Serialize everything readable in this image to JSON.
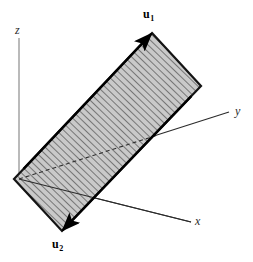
{
  "figure": {
    "background_color": "#ffffff"
  },
  "axes": [
    {
      "id": "z",
      "label": "z",
      "style": "italic",
      "color": "#8c8c8c",
      "x1": 19,
      "y1": 38,
      "x2": 19,
      "y2": 179,
      "arrow": false
    },
    {
      "id": "y",
      "label": "y",
      "style": "italic",
      "color": "#2b2b2b",
      "x1": 19,
      "y1": 179,
      "x2": 229,
      "y2": 112,
      "arrow": false
    },
    {
      "id": "x",
      "label": "x",
      "style": "italic",
      "color": "#2b2b2b",
      "x1": 19,
      "y1": 179,
      "x2": 191,
      "y2": 222,
      "arrow": false
    }
  ],
  "hidden_axis_segment": {
    "id": "y-hidden",
    "description": "dashed portion of y-axis occluded by the plane",
    "color": "#303030",
    "dash": "4 3",
    "x1": 19,
    "y1": 179,
    "x2": 158,
    "y2": 135
  },
  "plane": {
    "name": "spanned-plane",
    "fill_color": "#c9c9c9",
    "stroke_color": "#141414",
    "stroke_width": 2.2,
    "hatch_color": "#555555",
    "hatch_spacing": 5,
    "vertices": [
      {
        "x": 152,
        "y": 33
      },
      {
        "x": 201,
        "y": 86
      },
      {
        "x": 62,
        "y": 231
      },
      {
        "x": 14,
        "y": 179
      }
    ]
  },
  "vectors": [
    {
      "id": "u1",
      "label": "u",
      "subscript": "1",
      "color": "#000000",
      "x1": 14,
      "y1": 179,
      "x2": 152,
      "y2": 33,
      "arrow": true,
      "arrow_size": 11
    },
    {
      "id": "u2",
      "label": "u",
      "subscript": "2",
      "color": "#000000",
      "x1": 201,
      "y1": 86,
      "x2": 62,
      "y2": 231,
      "arrow": true,
      "arrow_size": 11
    }
  ],
  "colors": {
    "plane_fill": "#c9c9c9",
    "plane_edge": "#141414",
    "hatch": "#555555",
    "axis_gray": "#8c8c8c",
    "axis_dark": "#2b2b2b",
    "text": "#1a1a1a"
  }
}
